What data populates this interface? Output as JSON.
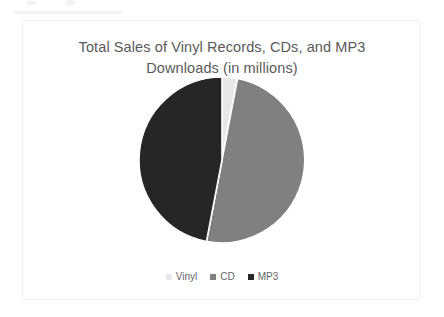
{
  "card": {
    "border_color": "#f0f0f0",
    "background": "#ffffff"
  },
  "title": {
    "line1": "Total Sales of Vinyl Records, CDs, and MP3",
    "line2": "Downloads (in millions)",
    "color": "#5a5a5a"
  },
  "legend": {
    "position": "bottom-center",
    "items": [
      {
        "label": "Vinyl",
        "color": "#e8e8e8"
      },
      {
        "label": "CD",
        "color": "#808080"
      },
      {
        "label": "MP3",
        "color": "#262626"
      }
    ]
  },
  "chart_data": {
    "type": "pie",
    "title": "Total Sales of Vinyl Records, CDs, and MP3 Downloads (in millions)",
    "xlabel": "",
    "ylabel": "",
    "categories": [
      "Vinyl",
      "CD",
      "MP3"
    ],
    "values": [
      3,
      50,
      47
    ],
    "units": "millions",
    "value_type": "percent_of_total",
    "colors": [
      "#e8e8e8",
      "#808080",
      "#262626"
    ],
    "start_angle_deg": 0,
    "direction": "clockwise",
    "slice_separator_color": "#ffffff",
    "data_labels_shown": false,
    "grid": false,
    "legend_entries": [
      "Vinyl",
      "CD",
      "MP3"
    ],
    "geometry": {
      "center_x": 199,
      "center_y": 87,
      "radius": 83
    },
    "slices": [
      {
        "name": "Vinyl",
        "value": 3,
        "start_deg": 0,
        "end_deg": 10.8,
        "color": "#e8e8e8"
      },
      {
        "name": "CD",
        "value": 50,
        "start_deg": 10.8,
        "end_deg": 190.8,
        "color": "#808080"
      },
      {
        "name": "MP3",
        "value": 47,
        "start_deg": 190.8,
        "end_deg": 360,
        "color": "#262626"
      }
    ]
  }
}
